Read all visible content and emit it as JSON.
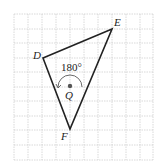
{
  "figure": {
    "labels": {
      "D": "D",
      "E": "E",
      "F": "F",
      "Q": "Q"
    },
    "angle_label": "180°",
    "colors": {
      "grid": "#c8c8c8",
      "shape": "#222222",
      "point": "#555555"
    }
  }
}
